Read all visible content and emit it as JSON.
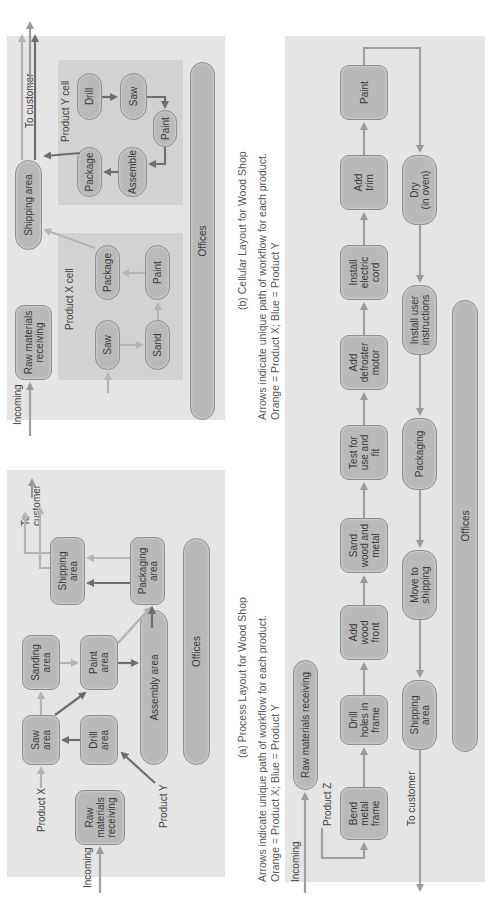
{
  "colors": {
    "panel_bg": "#e5e5e5",
    "cell_bg": "#d2d2d2",
    "node_fill": "#b9b9b9",
    "product_x_arrow": "#b4b4b4",
    "product_y_arrow": "#6e6e6e"
  },
  "panel_a": {
    "caption": "(a) Process Layout for Wood Shop",
    "note": "Arrows indicate unique path of workflow for each product.\nOrange = Product X; Blue = Product Y",
    "labels": {
      "incoming": "Incoming",
      "product_x": "Product X",
      "product_y": "Product Y",
      "to_customer": "To\ncustomer"
    },
    "nodes": {
      "raw_materials": "Raw\nmaterials\nreceiving",
      "saw": "Saw\narea",
      "drill": "Drill\narea",
      "sanding": "Sanding\narea",
      "paint": "Paint\narea",
      "assembly": "Assembly area",
      "shipping": "Shipping\narea",
      "packaging": "Packaging\narea",
      "offices": "Offices"
    }
  },
  "panel_b": {
    "caption": "(b) Cellular Layout for Wood Shop",
    "note": "Arrows indicate unique path of workflow for each product.\nOrange = Product X; Blue = Product Y",
    "labels": {
      "incoming": "Incoming",
      "to_customer": "To customer",
      "cell_x": "Product X cell",
      "cell_y": "Product Y cell"
    },
    "nodes": {
      "raw_materials": "Raw materials\nreceiving",
      "shipping": "Shipping area",
      "x_saw": "Saw",
      "x_sand": "Sand",
      "x_paint": "Paint",
      "x_package": "Package",
      "y_drill": "Drill",
      "y_saw": "Saw",
      "y_paint": "Paint",
      "y_assemble": "Assemble",
      "y_package": "Package",
      "offices": "Offices"
    }
  },
  "panel_c": {
    "labels": {
      "incoming": "Incoming",
      "product_z": "Product Z",
      "to_customer": "To customer"
    },
    "nodes": {
      "raw_materials": "Raw materials receiving",
      "bend": "Bend\nmetal\nframe",
      "drill_holes": "Drill\nholes in\nframe",
      "add_wood": "Add\nwood\nfront",
      "sand": "Sand\nwood and\nmetal",
      "test": "Test for\nuse and\nfit",
      "defroster": "Add\ndefroster\nmotor",
      "cord": "Install\nelectric\ncord",
      "trim": "Add\ntrim",
      "paint": "Paint",
      "dry": "Dry\n(in oven)",
      "instructions": "Install user\ninstructions",
      "packaging": "Packaging",
      "move": "Move to\nshipping",
      "shipping": "Shipping\narea",
      "offices": "Offices"
    }
  }
}
